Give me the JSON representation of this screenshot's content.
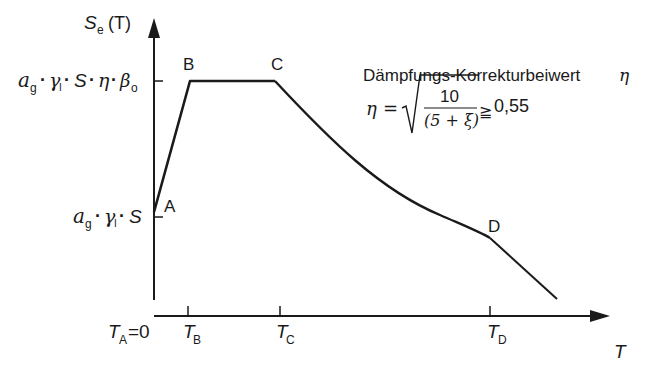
{
  "diagram": {
    "y_axis": {
      "symbol": "S",
      "subscript": "e",
      "argument": "(T)"
    },
    "x_axis": {
      "symbol": "T"
    },
    "points": [
      {
        "label": "A",
        "t": "T_A = 0"
      },
      {
        "label": "B",
        "t": "T_B"
      },
      {
        "label": "C",
        "t": "T_C"
      },
      {
        "label": "D",
        "t": "T_D"
      }
    ],
    "x_ticks": [
      {
        "main": "T",
        "sub": "A",
        "suffix": "=0"
      },
      {
        "main": "T",
        "sub": "B",
        "suffix": ""
      },
      {
        "main": "T",
        "sub": "C",
        "suffix": ""
      },
      {
        "main": "T",
        "sub": "D",
        "suffix": ""
      }
    ],
    "y_ticks": [
      {
        "expression": "a_g · γ_I · S · η · β_o",
        "parts": {
          "a": "a",
          "g": "g",
          "gamma": "γ",
          "I": "I",
          "S": "S",
          "eta": "η",
          "beta": "β",
          "o": "o",
          "dot": "·"
        }
      },
      {
        "expression": "a_g · γ_I · S",
        "parts": {
          "a": "a",
          "g": "g",
          "gamma": "γ",
          "I": "I",
          "S": "S",
          "dot": "·"
        }
      }
    ],
    "annotation": {
      "heading": "Dämpfungs-Korrekturbeiwert",
      "heading_symbol": "η",
      "formula": {
        "lhs": "η",
        "equals": "=",
        "numerator": "10",
        "denominator": "(5 + ξ)",
        "relation": "≧",
        "bound": "0,55"
      }
    }
  }
}
